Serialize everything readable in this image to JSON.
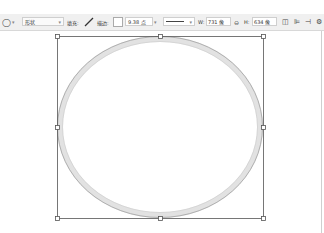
{
  "options_bar": {
    "tool_icon": "ellipse-tool-icon",
    "tool_glyph": "◯",
    "tool_caret": "▾",
    "mode": {
      "value": "形状",
      "caret": "▾"
    },
    "fill": {
      "label": "填充:",
      "icon": "diagonal-slash-no-fill",
      "glyph": "/"
    },
    "stroke": {
      "label": "描边:",
      "color": "#ffffff"
    },
    "stroke_width": {
      "value": "9.38 点",
      "caret": "▾"
    },
    "stroke_type": {
      "caret": "▾"
    },
    "width": {
      "label": "W:",
      "value": "731 像"
    },
    "link_icon": "link-icon",
    "link_glyph": "⊖",
    "height": {
      "label": "H:",
      "value": "634 像"
    },
    "path_operations": [
      {
        "name": "path-operations-icon",
        "glyph": "◫"
      },
      {
        "name": "path-alignment-icon",
        "glyph": "⊫"
      },
      {
        "name": "path-arrangement-icon",
        "glyph": "⊣"
      },
      {
        "name": "settings-gear-icon",
        "glyph": "⚙"
      }
    ]
  },
  "canvas": {
    "background": "#ffffff",
    "shape": {
      "type": "ellipse",
      "stroke_color": "#d4d4d4",
      "outline_color": "#555555",
      "bounding_box": {
        "x": 57,
        "y": 36,
        "width": 206,
        "height": 182
      }
    }
  }
}
